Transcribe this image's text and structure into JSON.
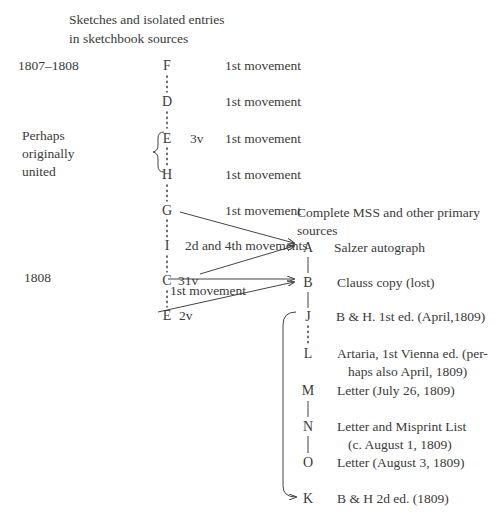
{
  "left_header": [
    "Sketches and isolated entries",
    "in sketchbook sources"
  ],
  "right_header": [
    "Complete MSS and other primary",
    "sources"
  ],
  "dates": {
    "first": "1807–1808",
    "second": "1808"
  },
  "bracket_note": [
    "Perhaps",
    "originally",
    "united"
  ],
  "sketch_sources": [
    {
      "letter": "F",
      "folio": "",
      "description": "1st movement"
    },
    {
      "letter": "D",
      "folio": "",
      "description": "1st movement"
    },
    {
      "letter": "E",
      "folio": "3v",
      "description": "1st movement"
    },
    {
      "letter": "H",
      "folio": "",
      "description": "1st movement"
    },
    {
      "letter": "G",
      "folio": "",
      "description": "1st movement"
    },
    {
      "letter": "I",
      "folio": "",
      "description": "2d and 4th movements"
    },
    {
      "letter": "C",
      "folio": "31v",
      "description": "1st movement"
    },
    {
      "letter": "E",
      "folio": "2v",
      "description": ""
    }
  ],
  "primary_sources": [
    {
      "letter": "A",
      "description": "Salzer autograph"
    },
    {
      "letter": "B",
      "description": "Clauss copy (lost)"
    },
    {
      "letter": "J",
      "description": "B & H. 1st ed. (April,1809)"
    },
    {
      "letter": "L",
      "description": [
        "Artaria, 1st Vienna ed. (per-",
        "haps also April, 1809)"
      ]
    },
    {
      "letter": "M",
      "description": "Letter (July 26, 1809)"
    },
    {
      "letter": "N",
      "description": [
        "Letter and Misprint List",
        "(c. August 1, 1809)"
      ]
    },
    {
      "letter": "O",
      "description": "Letter (August 3, 1809)"
    },
    {
      "letter": "K",
      "description": "B & H 2d ed. (1809)"
    }
  ],
  "arrows": [
    {
      "from": "G",
      "to": "A"
    },
    {
      "from": "C 31v",
      "to": "A"
    },
    {
      "from": "C 31v",
      "to": "B",
      "label": "1st movement"
    },
    {
      "from": "E 2v",
      "to": "B"
    },
    {
      "from": "J",
      "to": "K"
    }
  ]
}
